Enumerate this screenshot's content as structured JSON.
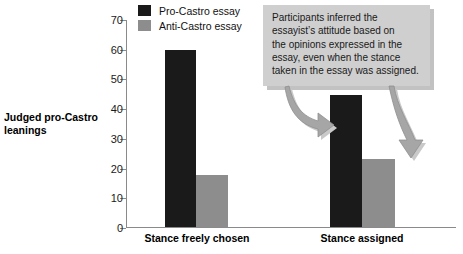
{
  "chart_data": {
    "type": "bar",
    "title": "",
    "xlabel": "",
    "ylabel": "Judged pro-Castro leanings",
    "ylim": [
      0,
      70
    ],
    "yticks": [
      0,
      10,
      20,
      30,
      40,
      50,
      60,
      70
    ],
    "grid": false,
    "legend_position": "top-left",
    "categories": [
      "Stance freely chosen",
      "Stance assigned"
    ],
    "series": [
      {
        "name": "Pro-Castro essay",
        "values": [
          60,
          44.5
        ],
        "color": "#1a1a1a"
      },
      {
        "name": "Anti-Castro essay",
        "values": [
          17.5,
          23
        ],
        "color": "#8d8d8d"
      }
    ],
    "annotations": [
      {
        "name": "callout",
        "text": "Participants inferred the essayist's attitude based on the opinions expressed in the essay, even when the stance taken in the essay was assigned.",
        "lines": [
          "Participants inferred the",
          "essayist’s attitude based on",
          "the opinions expressed in the",
          "essay, even when the stance",
          "taken in the essay was assigned."
        ],
        "background": "#cfcfcf",
        "points_to": [
          "Stance assigned / Pro-Castro essay",
          "Stance assigned / Anti-Castro essay"
        ]
      }
    ]
  },
  "axis": {
    "y_title_line1": "Judged pro-Castro",
    "y_title_line2": "leanings",
    "tick_labels": [
      "70",
      "60",
      "50",
      "40",
      "30",
      "20",
      "10",
      "0"
    ]
  },
  "legend": {
    "items": [
      {
        "label": "Pro-Castro essay",
        "swatch": "black-swatch"
      },
      {
        "label": "Anti-Castro essay",
        "swatch": "gray-swatch"
      }
    ]
  },
  "categories": [
    {
      "label": "Stance freely chosen"
    },
    {
      "label": "Stance assigned"
    }
  ],
  "callout": {
    "line1": "Participants inferred the",
    "line2": "essayist’s attitude based on",
    "line3": "the opinions expressed in the",
    "line4": "essay, even when the stance",
    "line5": "taken in the essay was assigned."
  }
}
